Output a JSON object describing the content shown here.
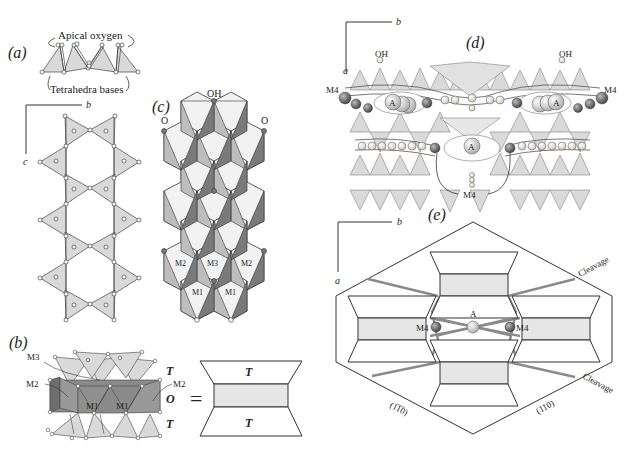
{
  "figure": {
    "panels": {
      "a": {
        "label": "(a)",
        "apical_label": "Apical oxygen",
        "bases_label": "Tetrahedra bases",
        "axis_b": "b",
        "axis_c": "c"
      },
      "b": {
        "label": "(b)",
        "site_labels": [
          "M3",
          "M2",
          "M1",
          "M1",
          "M2"
        ],
        "layer_labels": [
          "T",
          "O",
          "T"
        ],
        "equals": "=",
        "block_top": "T",
        "block_bottom": "T"
      },
      "c": {
        "label": "(c)",
        "oh_label": "OH",
        "o_left": "O",
        "o_right": "O",
        "site_labels": [
          "M2",
          "M3",
          "M2",
          "M1",
          "M1"
        ]
      },
      "d": {
        "label": "(d)",
        "axis_b": "b",
        "axis_a": "a",
        "oh_left": "OH",
        "oh_right": "OH",
        "m4_left": "M4",
        "m4_right": "M4",
        "a_site": "A",
        "m4_bottom": "M4"
      },
      "e": {
        "label": "(e)",
        "axis_b": "b",
        "axis_a": "a",
        "cleavage_top": "Cleavage",
        "cleavage_bottom": "Cleavage",
        "a_site": "A",
        "m4_left": "M4",
        "m4_right": "M4",
        "face_left": "(1̅1̅0)",
        "face_left_plain": "(1̄ 10)",
        "face_right": "(110)"
      }
    },
    "colors": {
      "tetra_fill": "#d9d9d9",
      "octa_light": "#f2f2f2",
      "octa_mid": "#bdbdbd",
      "octa_dark": "#7a7a7a",
      "line": "#333333",
      "cleavage_line": "#8a8a8a",
      "m4_sphere": "#666666"
    }
  }
}
